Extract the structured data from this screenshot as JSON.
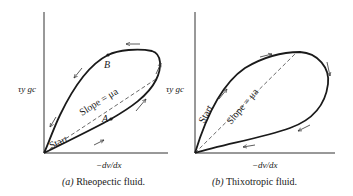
{
  "figures": [
    {
      "id": "a",
      "y_label": "τy gc",
      "x_label": "−dv/dx",
      "caption_letter": "(a)",
      "caption_text": "Rheopectic fluid.",
      "slope_label": "Slope = μa",
      "start_label": "Start",
      "point_labels": [
        "A",
        "B"
      ]
    },
    {
      "id": "b",
      "y_label": "τy gc",
      "x_label": "−dv/dx",
      "caption_letter": "(b)",
      "caption_text": "Thixotropic fluid.",
      "slope_label": "Slope = μa",
      "start_label": "Start"
    }
  ]
}
